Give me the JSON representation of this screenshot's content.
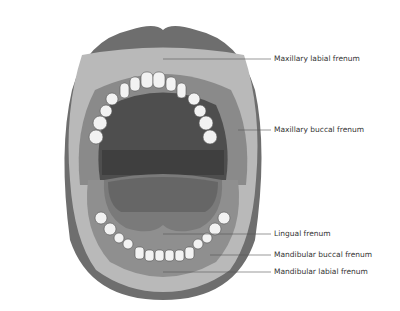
{
  "diagram": {
    "labels": [
      {
        "id": "maxillary-labial",
        "text": "Maxillary labial frenum",
        "x": 274,
        "y": 57
      },
      {
        "id": "maxillary-buccal",
        "text": "Maxillary buccal frenum",
        "x": 274,
        "y": 128
      },
      {
        "id": "lingual",
        "text": "Lingual frenum",
        "x": 274,
        "y": 232
      },
      {
        "id": "mandibular-buccal",
        "text": "Mandibular buccal frenum",
        "x": 274,
        "y": 253
      },
      {
        "id": "mandibular-labial",
        "text": "Mandibular labial frenum",
        "x": 274,
        "y": 270
      }
    ]
  }
}
